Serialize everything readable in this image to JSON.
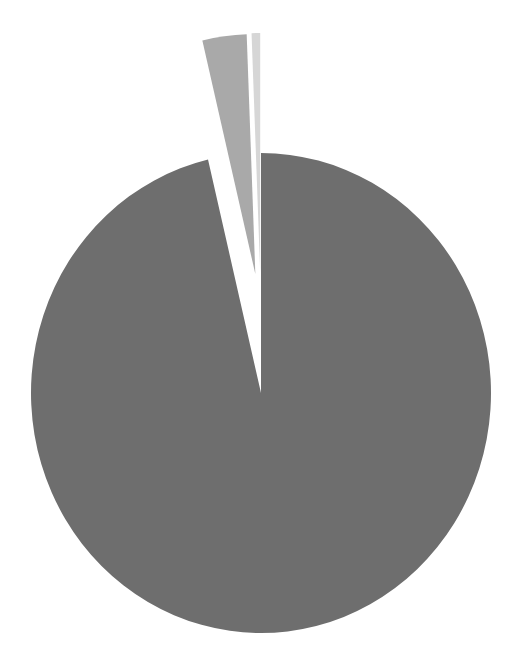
{
  "chart_data": {
    "type": "pie",
    "title": "",
    "legend": null,
    "labels_visible": false,
    "exploded": [
      false,
      true,
      true
    ],
    "slices": [
      {
        "name": "slice-1",
        "value": 96.3,
        "color": "#6e6e6e"
      },
      {
        "name": "slice-2",
        "value": 3.1,
        "color": "#a9a9a9"
      },
      {
        "name": "slice-3",
        "value": 0.6,
        "color": "#d6d6d6"
      }
    ],
    "start_angle_deg": 0,
    "direction": "clockwise"
  },
  "geometry": {
    "cx": 261,
    "cy": 393,
    "rx": 230,
    "ry": 240,
    "explode_offset": 120
  }
}
